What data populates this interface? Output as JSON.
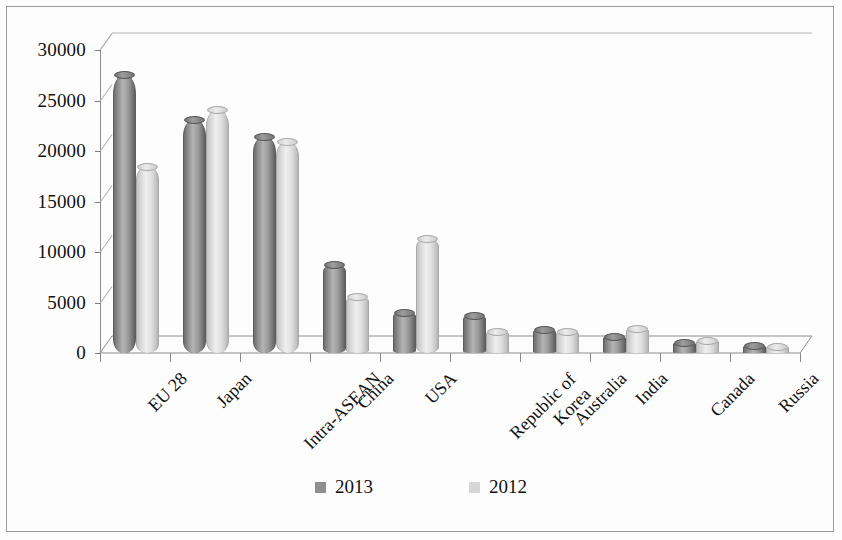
{
  "chart_data": {
    "type": "bar",
    "title": "",
    "subtitle": "",
    "xlabel": "",
    "ylabel": "",
    "grid": true,
    "legend_position": "bottom",
    "ylim": [
      0,
      30000
    ],
    "ytick_step": 5000,
    "yticks": [
      0,
      5000,
      10000,
      15000,
      20000,
      25000,
      30000
    ],
    "ytick_labels": [
      "0",
      "5000",
      "10000",
      "15000",
      "20000",
      "25000",
      "30000"
    ],
    "categories": [
      "EU 28",
      "Japan",
      "Intra-ASEAN",
      "China",
      "Republic of\nKorea",
      "USA",
      "Australia",
      "India",
      "Canada",
      "Russia"
    ],
    "category_labels": [
      "EU 28",
      "Japan",
      "Intra-ASEAN",
      "China",
      "USA",
      "Republic of Korea",
      "Australia",
      "India",
      "Canada",
      "Russia"
    ],
    "series": [
      {
        "name": "2013",
        "color": "#8f8f8f",
        "values": [
          27500,
          23100,
          21400,
          8700,
          4000,
          3700,
          2300,
          1600,
          1000,
          700
        ]
      },
      {
        "name": "2012",
        "color": "#d6d6d6",
        "values": [
          18400,
          24100,
          20900,
          5500,
          11300,
          2100,
          2100,
          2400,
          1200,
          600
        ]
      }
    ]
  },
  "legend": {
    "items": [
      {
        "label": "2013",
        "color": "#8f8f8f"
      },
      {
        "label": "2012",
        "color": "#d6d6d6"
      }
    ]
  },
  "xlabels": [
    {
      "line1": "EU 28",
      "line2": ""
    },
    {
      "line1": "Japan",
      "line2": ""
    },
    {
      "line1": "Intra-ASEAN",
      "line2": ""
    },
    {
      "line1": "China",
      "line2": ""
    },
    {
      "line1": "USA",
      "line2": ""
    },
    {
      "line1": "Republic of",
      "line2": "Korea"
    },
    {
      "line1": "Australia",
      "line2": ""
    },
    {
      "line1": "India",
      "line2": ""
    },
    {
      "line1": "Canada",
      "line2": ""
    },
    {
      "line1": "Russia",
      "line2": ""
    }
  ]
}
